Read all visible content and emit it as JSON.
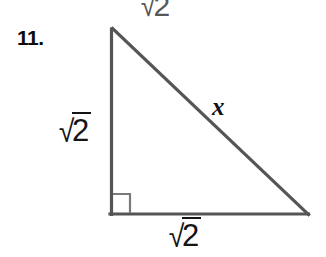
{
  "page": {
    "width": 326,
    "height": 257,
    "background_color": "#ffffff",
    "kind": "scanned-worksheet-geometry-figure"
  },
  "problem": {
    "number_label": "11."
  },
  "figure": {
    "shape": "right-triangle",
    "stroke_color": "#555555",
    "stroke_width": 3,
    "right_angle_marker": {
      "present": true,
      "color": "#777777",
      "size": 18
    },
    "vertices": {
      "apex": {
        "x": 112,
        "y": 28
      },
      "right_angle": {
        "x": 110,
        "y": 214
      },
      "base_right": {
        "x": 308,
        "y": 214
      }
    },
    "labels": {
      "leg_vertical": {
        "sign": "√",
        "radicand": "2",
        "text": "√2"
      },
      "leg_horizontal": {
        "sign": "√",
        "radicand": "2",
        "text": "√2"
      },
      "hypotenuse": {
        "text": "x"
      }
    }
  },
  "artifact": {
    "description": "clipped-radical-from-previous-problem",
    "sign": "√",
    "radicand": "2",
    "text": "√2"
  }
}
